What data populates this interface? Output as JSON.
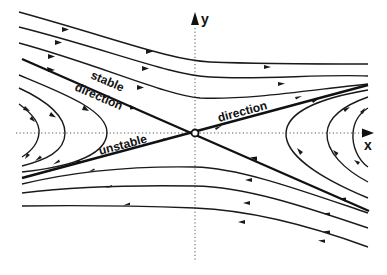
{
  "diagram": {
    "axes": {
      "x_label": "x",
      "y_label": "y"
    },
    "labels": {
      "stable_line1": "stable",
      "stable_line2": "direction",
      "unstable_word": "unstable",
      "unstable_direction_word": "direction"
    },
    "colors": {
      "line": "#1a1a1a",
      "axis": "#555555",
      "background": "#ffffff"
    },
    "fixed_point": {
      "type": "saddle",
      "marker": "open-circle"
    }
  }
}
